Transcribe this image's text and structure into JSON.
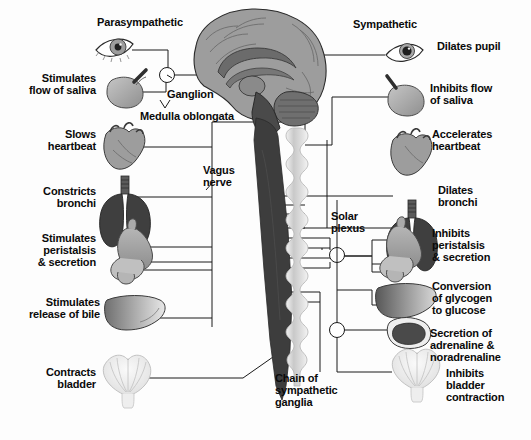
{
  "diagram": {
    "type": "anatomical-diagram",
    "background_color": "#fdfdfd",
    "text_color": "#0a0a0a",
    "line_color": "#1a1a1a"
  },
  "headings": {
    "left": "Parasympathetic",
    "right": "Sympathetic"
  },
  "central": {
    "ganglion": "Ganglion",
    "medulla": "Medulla oblongata",
    "vagus": "Vagus\nnerve",
    "solar_plexus": "Solar\nplexus",
    "chain": "Chain of\nsympathetic\nganglia"
  },
  "parasympathetic": [
    {
      "label": "Stimulates\nflow of saliva",
      "organ": "salivary-gland"
    },
    {
      "label": "Slows\nheartbeat",
      "organ": "heart"
    },
    {
      "label": "Constricts\nbronchi",
      "organ": "lungs"
    },
    {
      "label": "Stimulates\nperistalsis\n& secretion",
      "organ": "stomach"
    },
    {
      "label": "Stimulates\nrelease of bile",
      "organ": "liver"
    },
    {
      "label": "Contracts\nbladder",
      "organ": "bladder"
    }
  ],
  "sympathetic": [
    {
      "label": "Dilates pupil",
      "organ": "eye"
    },
    {
      "label": "Inhibits flow\nof saliva",
      "organ": "salivary-gland"
    },
    {
      "label": "Accelerates\nheartbeat",
      "organ": "heart"
    },
    {
      "label": "Dilates\nbronchi",
      "organ": "lungs"
    },
    {
      "label": "Inhibits\nperistalsis\n& secretion",
      "organ": "stomach"
    },
    {
      "label": "Conversion\nof glycogen\nto glucose",
      "organ": "liver"
    },
    {
      "label": "Secretion of\nadrenaline &\nnoradrenaline",
      "organ": "adrenal-gland"
    },
    {
      "label": "Inhibits\nbladder\ncontraction",
      "organ": "bladder"
    }
  ],
  "organs": {
    "eye_left": "eye",
    "brain": "brain-sagittal-section",
    "spinal_cord": "spinal-cord",
    "sympathetic_chain": "sympathetic-ganglia-chain"
  },
  "colors": {
    "brain_outer": "#9a9a9a",
    "brain_inner": "#6d6d6d",
    "cord_dark": "#3a3a3a",
    "organ_mid": "#8e8e8e",
    "organ_dark": "#4a4a4a",
    "organ_light": "#d2d2d2",
    "chain_light": "#d8d8d8"
  }
}
